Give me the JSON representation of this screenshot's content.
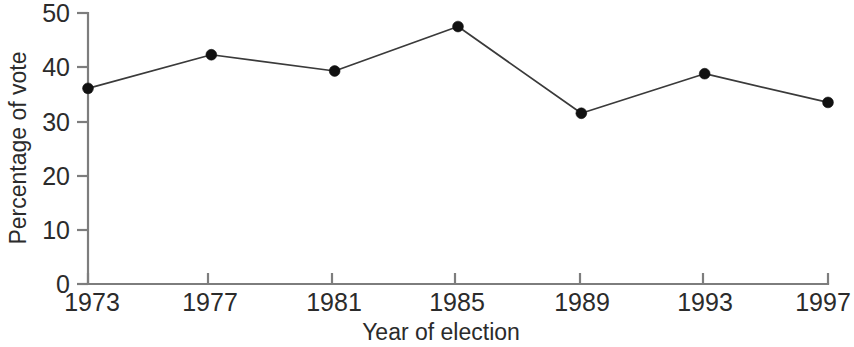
{
  "chart_data": {
    "type": "line",
    "title": "",
    "subtitle": "",
    "xlabel": "Year of election",
    "ylabel": "Percentage of vote",
    "x": [
      1973,
      1977,
      1981,
      1985,
      1989,
      1993,
      1997
    ],
    "xtick_labels": [
      "1973",
      "1977",
      "1981",
      "1985",
      "1989",
      "1993",
      "1997"
    ],
    "ytick_labels": [
      "0",
      "10",
      "20",
      "30",
      "40",
      "50"
    ],
    "yticks": [
      0,
      10,
      20,
      30,
      40,
      50
    ],
    "values": [
      36.1,
      42.3,
      39.3,
      47.5,
      31.5,
      38.8,
      33.5
    ],
    "series": [
      {
        "name": "Percentage of vote",
        "values": [
          36.1,
          42.3,
          39.3,
          47.5,
          31.5,
          38.8,
          33.5
        ]
      }
    ],
    "xlim": [
      1973,
      1997
    ],
    "ylim": [
      0,
      50
    ],
    "grid": false,
    "legend": false,
    "legend_position": "none",
    "marker": "filled-circle",
    "line_color": "#3a3a3a",
    "marker_color": "#111111",
    "axis_color": "#7d7d7d",
    "background_color": "#ffffff",
    "annotations": []
  }
}
